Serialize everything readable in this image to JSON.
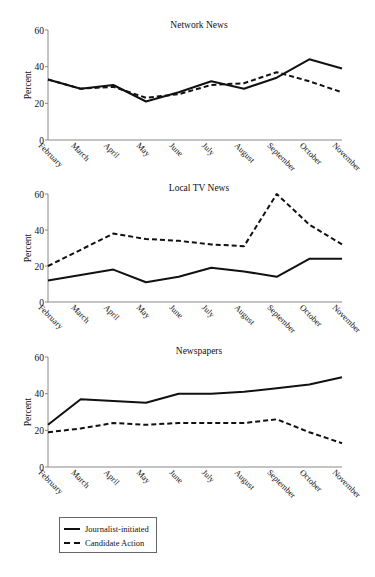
{
  "chart_data": [
    {
      "type": "line",
      "title": "Network News",
      "xlabel": "",
      "ylabel": "Percent",
      "ylim": [
        0,
        60
      ],
      "yticks": [
        0,
        20,
        40,
        60
      ],
      "grid": false,
      "categories": [
        "February",
        "March",
        "April",
        "May",
        "June",
        "July",
        "August",
        "September",
        "October",
        "November"
      ],
      "series": [
        {
          "name": "Journalist-initiated",
          "style": "solid",
          "values": [
            33,
            28,
            30,
            21,
            26,
            32,
            28,
            34,
            44,
            39
          ]
        },
        {
          "name": "Candidate Action",
          "style": "dashed",
          "values": [
            33,
            28,
            29,
            23,
            25,
            30,
            31,
            37,
            32,
            26
          ]
        }
      ]
    },
    {
      "type": "line",
      "title": "Local TV News",
      "xlabel": "",
      "ylabel": "Percent",
      "ylim": [
        0,
        60
      ],
      "yticks": [
        0,
        20,
        40,
        60
      ],
      "grid": false,
      "categories": [
        "February",
        "March",
        "April",
        "May",
        "June",
        "July",
        "August",
        "September",
        "October",
        "November"
      ],
      "series": [
        {
          "name": "Journalist-initiated",
          "style": "solid",
          "values": [
            12,
            15,
            18,
            11,
            14,
            19,
            17,
            14,
            24,
            24
          ]
        },
        {
          "name": "Candidate Action",
          "style": "dashed",
          "values": [
            20,
            29,
            38,
            35,
            34,
            32,
            31,
            60,
            43,
            32
          ]
        }
      ]
    },
    {
      "type": "line",
      "title": "Newspapers",
      "xlabel": "",
      "ylabel": "Percent",
      "ylim": [
        0,
        60
      ],
      "yticks": [
        0,
        20,
        40,
        60
      ],
      "grid": false,
      "categories": [
        "February",
        "March",
        "April",
        "May",
        "June",
        "July",
        "August",
        "September",
        "October",
        "November"
      ],
      "series": [
        {
          "name": "Journalist-initiated",
          "style": "solid",
          "values": [
            23,
            37,
            36,
            35,
            40,
            40,
            41,
            43,
            45,
            49
          ]
        },
        {
          "name": "Candidate Action",
          "style": "dashed",
          "values": [
            19,
            21,
            24,
            23,
            24,
            24,
            24,
            26,
            19,
            13
          ]
        }
      ]
    }
  ],
  "legend": {
    "items": [
      {
        "label": "Journalist-initiated",
        "style": "solid"
      },
      {
        "label": "Candidate Action",
        "style": "dashed"
      }
    ],
    "position": "bottom-left"
  },
  "colors": {
    "line": "#111111",
    "axis": "#888888",
    "background": "#ffffff"
  }
}
